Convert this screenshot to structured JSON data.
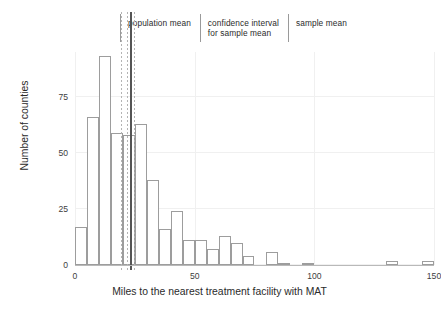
{
  "legend": {
    "items": [
      {
        "label": "population mean",
        "name": "legend-population-mean"
      },
      {
        "label": "confidence interval\nfor sample mean",
        "name": "legend-confidence-interval"
      },
      {
        "label": "sample mean",
        "name": "legend-sample-mean"
      }
    ]
  },
  "axes": {
    "xlabel": "Miles to the nearest treatment facility with MAT",
    "ylabel": "Number of counties",
    "xticks": [
      "0",
      "50",
      "100",
      "150"
    ],
    "yticks": [
      "0",
      "25",
      "50",
      "75"
    ]
  },
  "chart_data": {
    "type": "bar",
    "title": "",
    "xlabel": "Miles to the nearest treatment facility with MAT",
    "ylabel": "Number of counties",
    "xlim": [
      0,
      150
    ],
    "ylim": [
      0,
      95
    ],
    "xticks": [
      0,
      50,
      100,
      150
    ],
    "yticks": [
      0,
      25,
      50,
      75
    ],
    "grid": true,
    "legend_position": "top",
    "bin_width": 5,
    "bin_starts": [
      0,
      5,
      10,
      15,
      20,
      25,
      30,
      35,
      40,
      45,
      50,
      55,
      60,
      65,
      70,
      75,
      80,
      85,
      90,
      95,
      100,
      105,
      110,
      115,
      120,
      125,
      130,
      135,
      140,
      145
    ],
    "values": [
      17,
      66,
      93,
      59,
      58,
      63,
      38,
      16,
      24,
      11,
      11,
      7,
      13,
      10,
      4,
      0,
      6,
      1,
      0,
      1,
      0,
      0,
      0,
      0,
      0,
      0,
      2,
      0,
      0,
      2
    ],
    "reference_lines": [
      {
        "name": "population mean",
        "x": 19.2,
        "style": "dashed",
        "color": "#b4b4b4"
      },
      {
        "name": "confidence interval lower",
        "x": 21.6,
        "style": "dashed",
        "color": "#b4b4b4"
      },
      {
        "name": "sample mean",
        "x": 23.0,
        "style": "solid",
        "color": "#555555"
      },
      {
        "name": "confidence interval upper",
        "x": 24.6,
        "style": "dashed",
        "color": "#b4b4b4"
      }
    ]
  }
}
